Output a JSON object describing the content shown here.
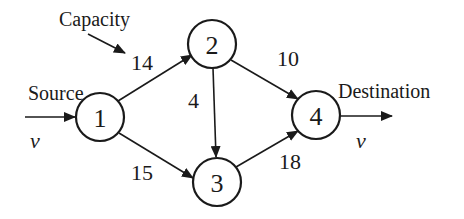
{
  "diagram": {
    "type": "flow-network",
    "annotations": {
      "capacity": "Capacity",
      "source": "Source",
      "destination": "Destination",
      "flow_in": "v",
      "flow_out": "v"
    },
    "nodes": [
      {
        "id": "1",
        "label": "1",
        "cx": 100,
        "cy": 117
      },
      {
        "id": "2",
        "label": "2",
        "cx": 212,
        "cy": 44
      },
      {
        "id": "3",
        "label": "3",
        "cx": 217,
        "cy": 182
      },
      {
        "id": "4",
        "label": "4",
        "cx": 316,
        "cy": 115
      }
    ],
    "edges": [
      {
        "from": "1",
        "to": "2",
        "capacity": "14"
      },
      {
        "from": "1",
        "to": "3",
        "capacity": "15"
      },
      {
        "from": "2",
        "to": "3",
        "capacity": "4"
      },
      {
        "from": "2",
        "to": "4",
        "capacity": "10"
      },
      {
        "from": "3",
        "to": "4",
        "capacity": "18"
      }
    ],
    "colors": {
      "stroke": "#1a1a1a",
      "background": "#ffffff"
    }
  }
}
